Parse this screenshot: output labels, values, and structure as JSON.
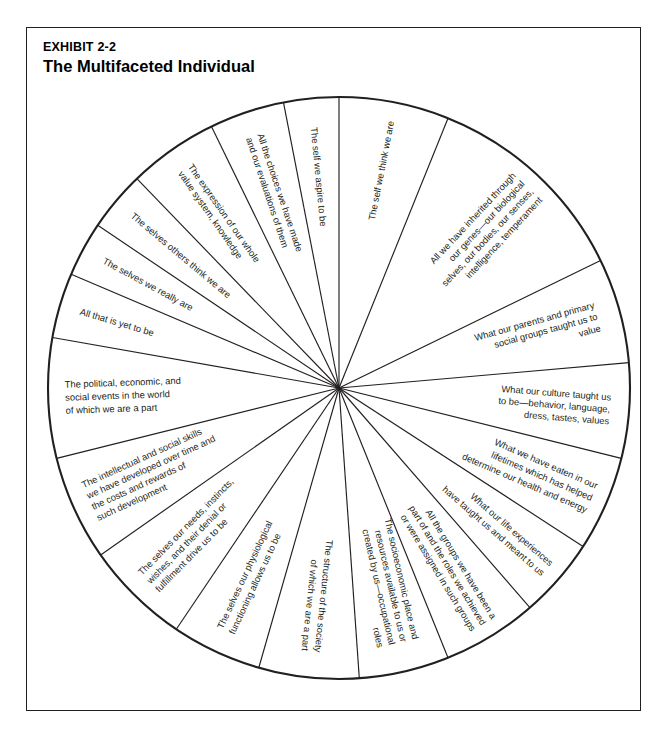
{
  "exhibit": {
    "number": "EXHIBIT 2-2",
    "title": "The Multifaceted Individual"
  },
  "diagram": {
    "type": "pie-wheel",
    "shape": "circle divided into 18 radial wedges",
    "center_x": 338,
    "center_y": 387,
    "radius": 291,
    "stroke_color": "#231f20",
    "fill_color": "#ffffff",
    "segment_count": 18,
    "segments": [
      {
        "index": 0,
        "start_angle": -90,
        "end_angle": -68,
        "text_lines": [
          "The self we think we are"
        ],
        "text_anchor": "end",
        "text_radius": 272,
        "line_spacing": 11
      },
      {
        "index": 1,
        "start_angle": -68,
        "end_angle": -26,
        "text_lines": [
          "All we have inherited through",
          "our genes—our biological",
          "selves, our bodies, our senses,",
          "intelligence, temperament"
        ],
        "text_anchor": "end",
        "text_radius": 276,
        "line_spacing": 12
      },
      {
        "index": 2,
        "start_angle": -26,
        "end_angle": -5,
        "text_lines": [
          "What our parents and primary",
          "social groups taught us to",
          "value"
        ],
        "text_anchor": "end",
        "text_radius": 268,
        "line_spacing": 12
      },
      {
        "index": 3,
        "start_angle": -5,
        "end_angle": 14,
        "text_lines": [
          "What our culture taught us",
          "to be—behavior, language,",
          "dress, tastes, values"
        ],
        "text_anchor": "end",
        "text_radius": 272,
        "line_spacing": 12
      },
      {
        "index": 4,
        "start_angle": 14,
        "end_angle": 33,
        "text_lines": [
          "What we have eaten in our",
          "lifetimes which has helped",
          "determine our health and energy"
        ],
        "text_anchor": "end",
        "text_radius": 276,
        "line_spacing": 13
      },
      {
        "index": 5,
        "start_angle": 33,
        "end_angle": 49,
        "text_lines": [
          "What our life experiences",
          "have taught us and meant to us"
        ],
        "text_anchor": "end",
        "text_radius": 276,
        "line_spacing": 13
      },
      {
        "index": 6,
        "start_angle": 49,
        "end_angle": 68,
        "text_lines": [
          "All the groups we have been a",
          "part of and the roles we achieved",
          "or were assigned in such groups"
        ],
        "text_anchor": "end",
        "text_radius": 277,
        "line_spacing": 12
      },
      {
        "index": 7,
        "start_angle": 68,
        "end_angle": 86,
        "text_lines": [
          "The socioeconomic place and",
          "resources available to us or",
          "created by us—occupational",
          "roles"
        ],
        "text_anchor": "end",
        "text_radius": 262,
        "line_spacing": 12
      },
      {
        "index": 8,
        "start_angle": 86,
        "end_angle": 106,
        "text_lines": [
          "The structure of the society",
          "of which we are a part"
        ],
        "text_anchor": "end",
        "text_radius": 265,
        "line_spacing": 13
      },
      {
        "index": 9,
        "start_angle": 106,
        "end_angle": 124,
        "text_lines": [
          "The selves our physiological",
          "functioning allows us to be"
        ],
        "text_anchor": "start",
        "text_radius": 268,
        "line_spacing": 13
      },
      {
        "index": 10,
        "start_angle": 124,
        "end_angle": 145,
        "text_lines": [
          "The selves our needs, instincts,",
          "wishes, and their denial or",
          "fulfillment drive us to be"
        ],
        "text_anchor": "start",
        "text_radius": 272,
        "line_spacing": 12
      },
      {
        "index": 11,
        "start_angle": 145,
        "end_angle": 166,
        "text_lines": [
          "The intellectual and social skills",
          "we have developed over time and",
          "the costs and rewards of",
          "such development"
        ],
        "text_anchor": "start",
        "text_radius": 274,
        "line_spacing": 12
      },
      {
        "index": 12,
        "start_angle": 166,
        "end_angle": 190,
        "text_lines": [
          "The political, economic, and",
          "social events in the world",
          "of which we are a part"
        ],
        "text_anchor": "start",
        "text_radius": 274,
        "line_spacing": 13
      },
      {
        "index": 13,
        "start_angle": 190,
        "end_angle": 203,
        "text_lines": [
          "All that is yet to be"
        ],
        "text_anchor": "start",
        "text_radius": 270,
        "line_spacing": 11
      },
      {
        "index": 14,
        "start_angle": 203,
        "end_angle": 214,
        "text_lines": [
          "The selves we really are"
        ],
        "text_anchor": "start",
        "text_radius": 268,
        "line_spacing": 11
      },
      {
        "index": 15,
        "start_angle": 214,
        "end_angle": 226,
        "text_lines": [
          "The selves others think we are"
        ],
        "text_anchor": "start",
        "text_radius": 270,
        "line_spacing": 11
      },
      {
        "index": 16,
        "start_angle": 226,
        "end_angle": 244,
        "text_lines": [
          "The expression of our whole",
          "value system, knowledge"
        ],
        "text_anchor": "start",
        "text_radius": 268,
        "line_spacing": 12
      },
      {
        "index": 17,
        "start_angle": 244,
        "end_angle": 259,
        "text_lines": [
          "All the choices we have made",
          "and our evaluations of them"
        ],
        "text_anchor": "start",
        "text_radius": 266,
        "line_spacing": 12
      },
      {
        "index": 18,
        "start_angle": 259,
        "end_angle": 270,
        "text_lines": [
          "The self we aspire to be"
        ],
        "text_anchor": "start",
        "text_radius": 262,
        "line_spacing": 11
      }
    ]
  }
}
